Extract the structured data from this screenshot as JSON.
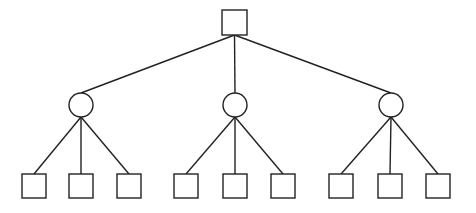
{
  "diagram": {
    "type": "tree",
    "stroke_color": "#222222",
    "fill_color": "#ffffff",
    "root": {
      "shape": "square",
      "x": 222,
      "y": 10,
      "size": 25
    },
    "level1": [
      {
        "shape": "circle",
        "cx": 81,
        "cy": 105,
        "r": 12,
        "children": [
          {
            "shape": "square",
            "x": 22,
            "y": 174,
            "size": 24
          },
          {
            "shape": "square",
            "x": 69,
            "y": 174,
            "size": 24
          },
          {
            "shape": "square",
            "x": 117,
            "y": 174,
            "size": 24
          }
        ]
      },
      {
        "shape": "circle",
        "cx": 235,
        "cy": 105,
        "r": 12,
        "children": [
          {
            "shape": "square",
            "x": 174,
            "y": 174,
            "size": 24
          },
          {
            "shape": "square",
            "x": 223,
            "y": 174,
            "size": 24
          },
          {
            "shape": "square",
            "x": 271,
            "y": 174,
            "size": 24
          }
        ]
      },
      {
        "shape": "circle",
        "cx": 391,
        "cy": 105,
        "r": 12,
        "children": [
          {
            "shape": "square",
            "x": 329,
            "y": 174,
            "size": 24
          },
          {
            "shape": "square",
            "x": 378,
            "y": 174,
            "size": 24
          },
          {
            "shape": "square",
            "x": 426,
            "y": 174,
            "size": 24
          }
        ]
      }
    ]
  }
}
